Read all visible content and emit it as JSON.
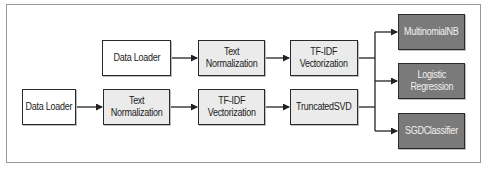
{
  "diagram": {
    "top_pipeline": {
      "data_loader": "Data Loader",
      "text_normalization": "Text\nNormalization",
      "tfidf": "TF-IDF\nVectorization"
    },
    "bottom_pipeline": {
      "data_loader": "Data Loader",
      "text_normalization": "Text\nNormalization",
      "tfidf": "TF-IDF\nVectorization",
      "svd": "TruncatedSVD"
    },
    "models": {
      "multinomial_nb": "MultinomialNB",
      "logistic_regression": "Logistic\nRegression",
      "sgd_classifier": "SGDClassifier"
    },
    "colors": {
      "border": "#2a2a2a",
      "white_box": "#ffffff",
      "light_box": "#ebebeb",
      "dark_box": "#7a7a7a",
      "frame": "#9a9a9a"
    }
  }
}
